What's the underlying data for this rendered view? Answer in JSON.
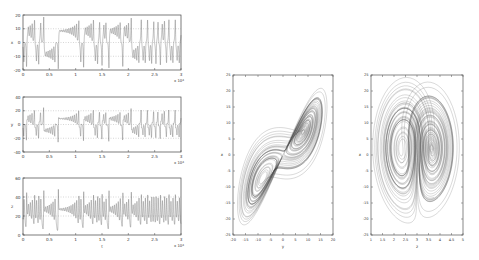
{
  "chart_data": [
    {
      "type": "line",
      "title": "",
      "xlabel": "",
      "ylabel": "x",
      "xlim": [
        0,
        3
      ],
      "ylim": [
        -20,
        20
      ],
      "x_multiplier": "x 10^4",
      "xticks": [
        "0",
        "0.5",
        "1",
        "1.5",
        "2",
        "2.5",
        "3"
      ],
      "yticks": [
        "20",
        "10",
        "0",
        "-10",
        "-20"
      ],
      "grid": "dotted horizontal at ticks",
      "description": "Chaotic oscillation of x over time, switching between lobes around +10 and -10"
    },
    {
      "type": "line",
      "title": "",
      "xlabel": "",
      "ylabel": "y",
      "xlim": [
        0,
        3
      ],
      "ylim": [
        -40,
        40
      ],
      "x_multiplier": "x 10^4",
      "xticks": [
        "0",
        "0.5",
        "1",
        "1.5",
        "2",
        "2.5",
        "3"
      ],
      "yticks": [
        "40",
        "20",
        "0",
        "-20",
        "-40"
      ],
      "grid": "dotted horizontal at ticks",
      "description": "Chaotic oscillation of y over time, spikes roughly between -20 and 20"
    },
    {
      "type": "line",
      "title": "",
      "xlabel": "t",
      "ylabel": "z",
      "xlim": [
        0,
        3
      ],
      "ylim": [
        0,
        60
      ],
      "x_multiplier": "x 10^4",
      "xticks": [
        "0",
        "0.5",
        "1",
        "1.5",
        "2",
        "2.5",
        "3"
      ],
      "yticks": [
        "60",
        "40",
        "20",
        "0"
      ],
      "grid": "dotted horizontal at ticks",
      "description": "Oscillation of z over time, roughly between 10 and 45"
    },
    {
      "type": "line",
      "title": "",
      "xlabel": "y",
      "ylabel": "x",
      "xlim": [
        -20,
        20
      ],
      "ylim": [
        -25,
        25
      ],
      "xticks": [
        "-20",
        "-15",
        "-10",
        "-5",
        "0",
        "5",
        "10",
        "15",
        "20"
      ],
      "yticks": [
        "25",
        "20",
        "15",
        "10",
        "5",
        "0",
        "-5",
        "-10",
        "-15",
        "-20",
        "-25"
      ],
      "description": "Phase portrait: double-scroll attractor with two lobes along the diagonal"
    },
    {
      "type": "line",
      "title": "",
      "xlabel": "z",
      "ylabel": "x",
      "xlim": [
        1,
        5
      ],
      "ylim": [
        -25,
        25
      ],
      "xticks": [
        "1",
        "1.5",
        "2",
        "2.5",
        "3",
        "3.5",
        "4",
        "4.5",
        "5"
      ],
      "yticks": [
        "25",
        "20",
        "15",
        "10",
        "5",
        "0",
        "-5",
        "-10",
        "-15",
        "-20",
        "-25"
      ],
      "description": "Phase portrait: figure-eight shaped attractor with upper and lower loops"
    }
  ],
  "labels": {
    "ts1_ylabel": "x",
    "ts2_ylabel": "y",
    "ts3_ylabel": "z",
    "ts3_xlabel": "t",
    "exp": "x 10",
    "exp_sup": "4",
    "p1_xlabel": "y",
    "p1_ylabel": "x",
    "p2_xlabel": "z",
    "p2_ylabel": "x"
  }
}
